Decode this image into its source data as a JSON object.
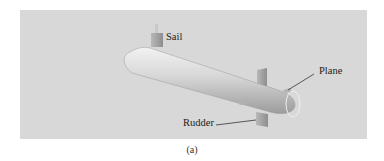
{
  "figure": {
    "caption": "(a)",
    "background_color": "#d8d8d8",
    "labels": {
      "sail": "Sail",
      "plane": "Plane",
      "rudder": "Rudder"
    }
  }
}
